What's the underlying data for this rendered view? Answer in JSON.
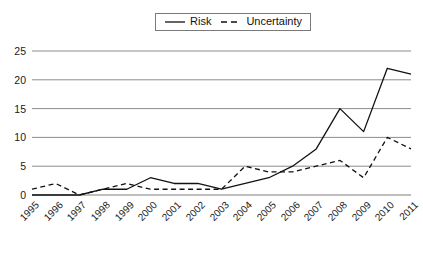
{
  "chart_data": {
    "type": "line",
    "title": "",
    "subtitle": "",
    "xlabel": "",
    "ylabel": "",
    "x": [
      1995,
      1996,
      1997,
      1998,
      1999,
      2000,
      2001,
      2002,
      2003,
      2004,
      2005,
      2006,
      2007,
      2008,
      2009,
      2010,
      2011
    ],
    "categories": [
      "1995",
      "1996",
      "1997",
      "1998",
      "1999",
      "2000",
      "2001",
      "2002",
      "2003",
      "2004",
      "2005",
      "2006",
      "2007",
      "2008",
      "2009",
      "2010",
      "2011"
    ],
    "series": [
      {
        "name": "Risk",
        "style": "solid",
        "color": "#111111",
        "values": [
          0,
          0,
          0,
          1,
          1,
          3,
          2,
          2,
          1,
          2,
          3,
          5,
          8,
          15,
          11,
          22,
          21
        ]
      },
      {
        "name": "Uncertainty",
        "style": "dashed",
        "color": "#111111",
        "values": [
          1,
          2,
          0,
          1,
          2,
          1,
          1,
          1,
          1,
          5,
          4,
          4,
          5,
          6,
          3,
          10,
          8
        ]
      }
    ],
    "ylim": [
      0,
      25
    ],
    "yticks": [
      0,
      5,
      10,
      15,
      20,
      25
    ],
    "ytick_labels": [
      "0",
      "5",
      "10",
      "15",
      "20",
      "25"
    ],
    "grid": true,
    "grid_axis": "y",
    "legend_position": "top-center",
    "legend_entries": [
      "Risk",
      "Uncertainty"
    ],
    "xtick_rotation": -45
  },
  "legend": {
    "risk_label": "Risk",
    "uncertainty_label": "Uncertainty"
  }
}
